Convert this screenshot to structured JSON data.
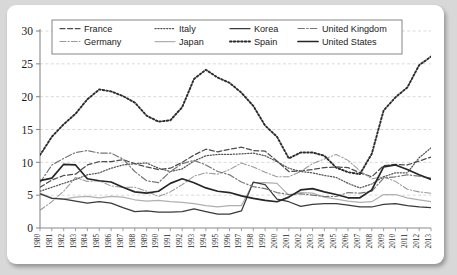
{
  "chart_data": {
    "type": "line",
    "title": "",
    "subtitle": "",
    "xlabel": "",
    "ylabel": "",
    "xlim": [
      1980,
      2013
    ],
    "ylim": [
      0,
      30
    ],
    "yticks": [
      0,
      5,
      10,
      15,
      20,
      25,
      30
    ],
    "grid": "horizontal-dashed",
    "legend_position": "top-inside",
    "x": [
      1980,
      1981,
      1982,
      1983,
      1984,
      1985,
      1986,
      1987,
      1988,
      1989,
      1990,
      1991,
      1992,
      1993,
      1994,
      1995,
      1996,
      1997,
      1998,
      1999,
      2000,
      2001,
      2002,
      2003,
      2004,
      2005,
      2006,
      2007,
      2008,
      2009,
      2010,
      2011,
      2012,
      2013
    ],
    "categories": [
      "1980",
      "1981",
      "1982",
      "1983",
      "1984",
      "1985",
      "1986",
      "1987",
      "1988",
      "1989",
      "1990",
      "1991",
      "1992",
      "1993",
      "1994",
      "1995",
      "1996",
      "1997",
      "1998",
      "1999",
      "2000",
      "2001",
      "2002",
      "2003",
      "2004",
      "2005",
      "2006",
      "2007",
      "2008",
      "2009",
      "2010",
      "2011",
      "2012",
      "2013"
    ],
    "series": [
      {
        "name": "France",
        "style": "dashed",
        "color": "#4d4d4d",
        "values": [
          6.2,
          7.3,
          8.0,
          8.2,
          9.6,
          10.1,
          10.1,
          10.4,
          9.8,
          9.3,
          8.9,
          9.1,
          10.0,
          11.1,
          12.0,
          11.6,
          12.0,
          12.3,
          11.8,
          11.7,
          10.2,
          8.6,
          8.7,
          8.9,
          9.2,
          9.3,
          9.2,
          8.4,
          7.8,
          9.5,
          9.7,
          9.6,
          10.2,
          10.8
        ]
      },
      {
        "name": "Germany",
        "style": "dash-dot-light",
        "color": "#9a9a9a",
        "values": [
          2.7,
          4.0,
          5.6,
          7.7,
          7.1,
          7.2,
          6.4,
          6.2,
          6.2,
          5.6,
          4.8,
          5.5,
          6.6,
          7.9,
          8.4,
          8.2,
          8.9,
          9.9,
          9.3,
          8.5,
          7.8,
          7.8,
          8.6,
          9.8,
          10.5,
          11.2,
          10.3,
          8.7,
          7.5,
          7.8,
          7.1,
          5.9,
          5.5,
          5.3
        ]
      },
      {
        "name": "Italy",
        "style": "dotted-fine",
        "color": "#555555",
        "values": [
          5.6,
          6.2,
          6.8,
          7.4,
          8.1,
          8.4,
          9.1,
          9.6,
          9.8,
          9.9,
          9.1,
          8.6,
          9.0,
          10.2,
          11.0,
          11.2,
          11.2,
          11.3,
          11.4,
          11.0,
          10.1,
          9.1,
          8.6,
          8.4,
          8.0,
          7.7,
          6.8,
          6.1,
          6.7,
          7.8,
          8.4,
          8.4,
          10.7,
          12.2
        ]
      },
      {
        "name": "Japan",
        "style": "solid-light",
        "color": "#b0b0b0",
        "values": [
          5.3,
          4.6,
          4.4,
          4.7,
          4.8,
          4.6,
          4.8,
          4.7,
          4.3,
          4.1,
          4.2,
          4.0,
          3.9,
          3.7,
          3.4,
          3.2,
          3.4,
          3.4,
          6.9,
          6.9,
          6.8,
          5.0,
          5.4,
          5.3,
          4.7,
          4.4,
          4.1,
          3.9,
          4.0,
          5.1,
          5.1,
          4.6,
          4.3,
          4.0
        ]
      },
      {
        "name": "Korea",
        "style": "solid-dark",
        "color": "#3a3a3a",
        "values": [
          5.2,
          4.5,
          4.4,
          4.1,
          3.8,
          4.0,
          3.8,
          3.1,
          2.5,
          2.6,
          2.4,
          2.4,
          2.5,
          2.9,
          2.5,
          2.1,
          2.1,
          2.6,
          7.0,
          6.6,
          4.4,
          4.0,
          3.3,
          3.6,
          3.7,
          3.7,
          3.5,
          3.2,
          3.2,
          3.6,
          3.7,
          3.4,
          3.2,
          3.1
        ]
      },
      {
        "name": "Spain",
        "style": "dotted-bold",
        "color": "#2b2b2b",
        "values": [
          11.1,
          13.9,
          15.8,
          17.4,
          19.6,
          21.1,
          20.8,
          20.1,
          19.1,
          17.1,
          16.2,
          16.4,
          18.4,
          22.7,
          24.1,
          22.9,
          22.1,
          20.6,
          18.6,
          15.6,
          13.9,
          10.6,
          11.5,
          11.5,
          11.0,
          9.2,
          8.5,
          8.2,
          11.3,
          17.9,
          19.9,
          21.4,
          24.8,
          26.1
        ]
      },
      {
        "name": "United Kingdom",
        "style": "dash-dot",
        "color": "#777777",
        "values": [
          6.9,
          9.6,
          10.6,
          11.5,
          11.8,
          11.4,
          11.4,
          10.5,
          8.6,
          7.2,
          6.9,
          8.6,
          9.8,
          10.3,
          9.6,
          8.6,
          8.1,
          7.0,
          6.3,
          6.0,
          5.4,
          5.1,
          5.2,
          5.0,
          4.8,
          4.8,
          5.4,
          5.3,
          5.6,
          7.6,
          7.8,
          8.1,
          7.9,
          7.6
        ]
      },
      {
        "name": "United States",
        "style": "solid-heavy",
        "color": "#262626",
        "values": [
          7.2,
          7.6,
          9.7,
          9.6,
          7.5,
          7.2,
          7.0,
          6.2,
          5.5,
          5.3,
          5.6,
          6.8,
          7.5,
          6.9,
          6.1,
          5.6,
          5.4,
          4.9,
          4.5,
          4.2,
          4.0,
          4.7,
          5.8,
          6.0,
          5.5,
          5.1,
          4.6,
          4.6,
          5.8,
          9.3,
          9.6,
          8.9,
          8.1,
          7.4
        ]
      }
    ]
  },
  "legend": {
    "items": [
      {
        "label": "France"
      },
      {
        "label": "Italy"
      },
      {
        "label": "Korea"
      },
      {
        "label": "United  Kingdom"
      },
      {
        "label": "Germany"
      },
      {
        "label": "Japan"
      },
      {
        "label": "Spain"
      },
      {
        "label": "United  States"
      }
    ]
  },
  "axes": {
    "y_labels": [
      "0",
      "5",
      "10",
      "15",
      "20",
      "25",
      "30"
    ],
    "x_labels": [
      "1980",
      "1981",
      "1982",
      "1983",
      "1984",
      "1985",
      "1986",
      "1987",
      "1988",
      "1989",
      "1990",
      "1991",
      "1992",
      "1993",
      "1994",
      "1995",
      "1996",
      "1997",
      "1998",
      "1999",
      "2000",
      "2001",
      "2002",
      "2003",
      "2004",
      "2005",
      "2006",
      "2007",
      "2008",
      "2009",
      "2010",
      "2011",
      "2012",
      "2013"
    ]
  },
  "colors": {
    "background": "#d8d8d8",
    "card": "#ffffff",
    "axis": "#8a8a8a",
    "grid": "#c9c9c9",
    "text": "#1a1a1a"
  }
}
